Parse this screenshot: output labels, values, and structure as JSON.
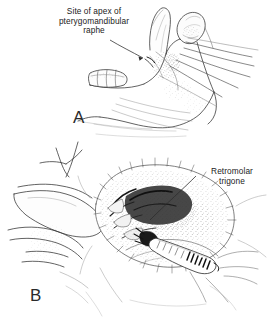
{
  "figure": {
    "kind": "anatomical-line-illustration",
    "background_color": "#ffffff",
    "ink_color": "#2a2a2a",
    "width": 270,
    "height": 332
  },
  "panels": [
    {
      "id": "A",
      "letter": "A",
      "caption_label": "A",
      "description": "Lateral view of mandible showing coronoid process, condyle, ramus and molar teeth",
      "labels": [
        {
          "name": "site-of-apex-of-pterygomandibular-raphe",
          "lines": [
            "Site of apex of",
            "pterygomandibular",
            "raphe"
          ],
          "text": "Site of apex of pterygomandibular raphe",
          "align": "center",
          "leader_line": true
        }
      ]
    },
    {
      "id": "B",
      "letter": "B",
      "caption_label": "B",
      "description": "Intraoral view with cheek retracted by fingers and syringe positioned at the retromolar trigone",
      "labels": [
        {
          "name": "retromolar-trigone",
          "lines": [
            "Retromolar",
            "trigone"
          ],
          "text": "Retromolar trigone",
          "align": "center",
          "leader_line": true
        }
      ]
    }
  ],
  "label_a": {
    "line1": "Site of apex of",
    "line2": "pterygomandibular",
    "line3": "raphe"
  },
  "label_b": {
    "line1": "Retromolar",
    "line2": "trigone"
  },
  "letters": {
    "a": "A",
    "b": "B"
  }
}
